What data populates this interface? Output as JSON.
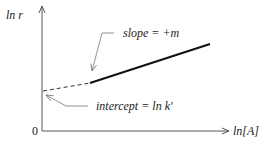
{
  "diagram": {
    "type": "line-plot-schematic",
    "y_axis_label": "ln r",
    "x_axis_label": "ln[A]",
    "origin_label": "0",
    "annotations": {
      "slope": "slope = +m",
      "intercept": "intercept = ln k′"
    },
    "colors": {
      "line": "#111111",
      "axis": "#555555",
      "leader": "#777777",
      "text": "#222222"
    }
  }
}
